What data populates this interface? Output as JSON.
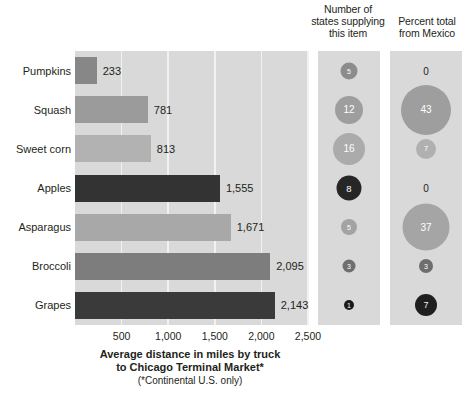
{
  "chart_data": {
    "type": "bar",
    "title": "Average distance in miles by truck to Chicago Terminal Market*",
    "note": "(*Continental U.S. only)",
    "xlabel": "Average distance in miles by truck to Chicago Terminal Market*",
    "ylabel": "",
    "xlim": [
      0,
      2500
    ],
    "xticks": [
      500,
      1000,
      1500,
      2000,
      2500
    ],
    "xtick_labels": [
      "500",
      "1,000",
      "1,500",
      "2,000",
      "2,500"
    ],
    "grid": true,
    "legend": "none",
    "categories": [
      "Pumpkins",
      "Squash",
      "Sweet corn",
      "Apples",
      "Asparagus",
      "Broccoli",
      "Grapes"
    ],
    "values": [
      233,
      781,
      813,
      1555,
      1671,
      2095,
      2143
    ],
    "value_labels": [
      "233",
      "781",
      "813",
      "1,555",
      "1,671",
      "2,095",
      "2,143"
    ],
    "bar_colors": [
      "#878787",
      "#9b9b9b",
      "#b2b2b2",
      "#333333",
      "#a8a8a8",
      "#7d7d7d",
      "#3a3a3a"
    ],
    "series": [
      {
        "name": "Number of states supplying this item",
        "values": [
          5,
          12,
          16,
          8,
          5,
          3,
          1
        ],
        "value_labels": [
          "5",
          "12",
          "16",
          "8",
          "5",
          "3",
          "1"
        ],
        "bubble_colors": [
          "#8c8c8c",
          "#9e9e9e",
          "#ababab",
          "#262626",
          "#a3a3a3",
          "#6e6e6e",
          "#1a1a1a"
        ],
        "bubble_text_colors": [
          "#ffffff",
          "#ffffff",
          "#ffffff",
          "#ffffff",
          "#ffffff",
          "#ffffff",
          "#ffffff"
        ],
        "bubble_diameters": [
          17,
          28,
          32,
          25,
          16,
          13,
          10
        ]
      },
      {
        "name": "Percent total from Mexico",
        "values": [
          0,
          43,
          7,
          0,
          37,
          3,
          7
        ],
        "value_labels": [
          "0",
          "43",
          "7",
          "0",
          "37",
          "3",
          "7"
        ],
        "bubble_colors": [
          null,
          "#9e9e9e",
          "#b0b0b0",
          null,
          "#a5a5a5",
          "#6e6e6e",
          "#1f1f1f"
        ],
        "bubble_text_colors": [
          "#231f20",
          "#ffffff",
          "#ffffff",
          "#231f20",
          "#ffffff",
          "#ffffff",
          "#ffffff"
        ],
        "bubble_diameters": [
          0,
          50,
          20,
          0,
          47,
          14,
          22
        ]
      }
    ]
  },
  "headers": {
    "states": "Number of states supplying this item",
    "mexico": "Percent total from Mexico"
  },
  "axis": {
    "title_line1": "Average distance in miles by truck",
    "title_line2": "to Chicago Terminal Market*",
    "note": "(*Continental U.S. only)"
  },
  "colors": {
    "panel_bg": "#d9d9d9",
    "gridline": "#f2f2f2",
    "page_bg": "#ffffff",
    "text": "#231f20"
  }
}
